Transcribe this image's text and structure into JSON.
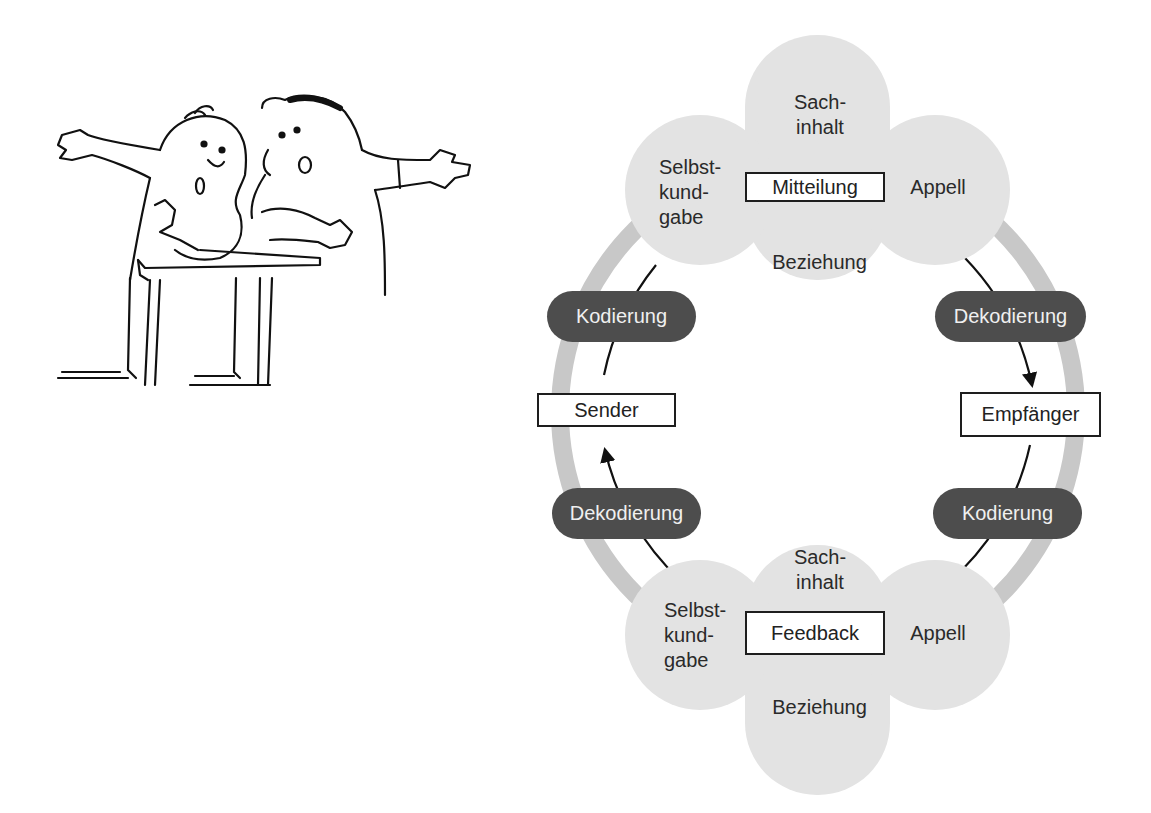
{
  "illustration": {
    "description": "cartoon of two surprised men leaning on a table, arms outstretched",
    "icon": "two-people-talking-cartoon"
  },
  "diagram": {
    "colors": {
      "petal": "#e3e3e3",
      "ring": "#c8c8c8",
      "pill": "#4d4d4d",
      "pill_text": "#f0f0f0",
      "line": "#111111"
    },
    "message_flower": {
      "center_label": "Mitteilung",
      "top": [
        "Sach-",
        "inhalt"
      ],
      "left": [
        "Selbst-",
        "kund-",
        "gabe"
      ],
      "right": "Appell",
      "bottom": "Beziehung"
    },
    "feedback_flower": {
      "center_label": "Feedback",
      "top": [
        "Sach-",
        "inhalt"
      ],
      "left": [
        "Selbst-",
        "kund-",
        "gabe"
      ],
      "right": "Appell",
      "bottom": "Beziehung"
    },
    "nodes": {
      "sender": "Sender",
      "receiver": "Empfänger"
    },
    "pills": {
      "left_top": "Kodierung",
      "right_top": "Dekodierung",
      "left_bottom": "Dekodierung",
      "right_bottom": "Kodierung"
    }
  }
}
